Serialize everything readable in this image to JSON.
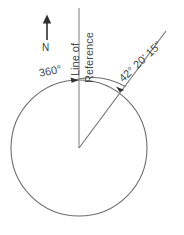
{
  "diagram": {
    "stroke_color": "#6e6e6e",
    "text_color": "#4a4a4a",
    "background_color": "#ffffff",
    "labels": {
      "north": "N",
      "line_of": "Line of",
      "reference": "Reference",
      "full_circle_angle": "360°",
      "bearing_angle": "42° 20' 15\""
    },
    "icons": {
      "north_arrow": "north-arrow-icon",
      "arc_start_arrow": "arrowhead-icon",
      "arc_end_arrow": "arrowhead-icon"
    },
    "geometry": {
      "circle_center_x": 79,
      "circle_center_y": 148,
      "circle_radius": 68,
      "reference_line_top_y": 8,
      "bearing_angle_degrees": 42.3375,
      "arc_radius": 69
    }
  }
}
